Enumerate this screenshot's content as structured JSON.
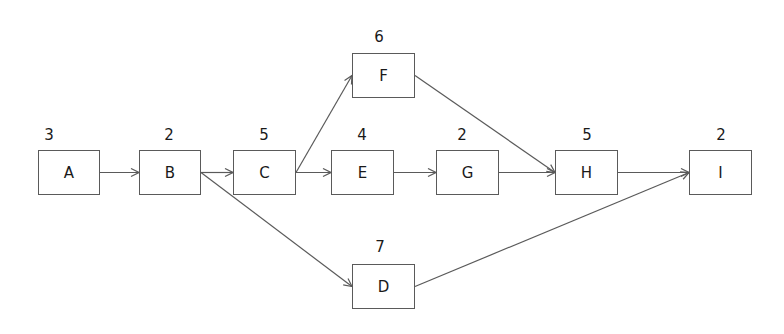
{
  "diagram": {
    "type": "activity-on-node network",
    "style": {
      "line_color": "#5a5a5a",
      "text_color": "#1a1a1a",
      "background": "#ffffff"
    },
    "nodes": [
      {
        "id": "A",
        "label": "A",
        "duration": "3",
        "x": 38,
        "y": 150,
        "w": 62,
        "h": 45
      },
      {
        "id": "B",
        "label": "B",
        "duration": "2",
        "x": 139,
        "y": 150,
        "w": 62,
        "h": 45
      },
      {
        "id": "C",
        "label": "C",
        "duration": "5",
        "x": 233,
        "y": 150,
        "w": 63,
        "h": 45
      },
      {
        "id": "E",
        "label": "E",
        "duration": "4",
        "x": 331,
        "y": 150,
        "w": 63,
        "h": 45
      },
      {
        "id": "G",
        "label": "G",
        "duration": "2",
        "x": 436,
        "y": 150,
        "w": 63,
        "h": 45
      },
      {
        "id": "H",
        "label": "H",
        "duration": "5",
        "x": 555,
        "y": 150,
        "w": 63,
        "h": 45
      },
      {
        "id": "I",
        "label": "I",
        "duration": "2",
        "x": 689,
        "y": 150,
        "w": 63,
        "h": 45
      },
      {
        "id": "F",
        "label": "F",
        "duration": "6",
        "x": 352,
        "y": 53,
        "w": 63,
        "h": 45
      },
      {
        "id": "D",
        "label": "D",
        "duration": "7",
        "x": 352,
        "y": 264,
        "w": 63,
        "h": 45
      }
    ],
    "edges": [
      {
        "from": "A",
        "to": "B"
      },
      {
        "from": "B",
        "to": "C"
      },
      {
        "from": "B",
        "to": "D"
      },
      {
        "from": "C",
        "to": "F"
      },
      {
        "from": "C",
        "to": "E"
      },
      {
        "from": "E",
        "to": "G"
      },
      {
        "from": "G",
        "to": "H"
      },
      {
        "from": "F",
        "to": "H"
      },
      {
        "from": "H",
        "to": "I"
      },
      {
        "from": "D",
        "to": "I"
      }
    ]
  }
}
